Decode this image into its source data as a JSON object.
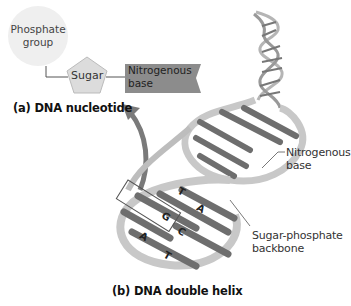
{
  "nucleotide": {
    "phosphate_label": [
      "Phosphate",
      "group"
    ],
    "sugar_label": "Sugar",
    "base_label": [
      "Nitrogenous",
      "base"
    ],
    "caption": "(a) DNA nucleotide"
  },
  "helix": {
    "base_label": [
      "Nitrogenous",
      "base"
    ],
    "backbone_label": [
      "Sugar-phosphate",
      "backbone"
    ],
    "base_pair_letters": [
      "T",
      "A",
      "G",
      "C",
      "A",
      "T"
    ],
    "caption": "(b) DNA double helix"
  },
  "colors": {
    "phosphate_fill": "#efefef",
    "sugar_fill": "#dcdcdc",
    "base_fill": "#8c8c8c",
    "arrow": "#7a7a7a",
    "helix_strand": "#c8c8c8",
    "rung": "#6e6e6e"
  }
}
